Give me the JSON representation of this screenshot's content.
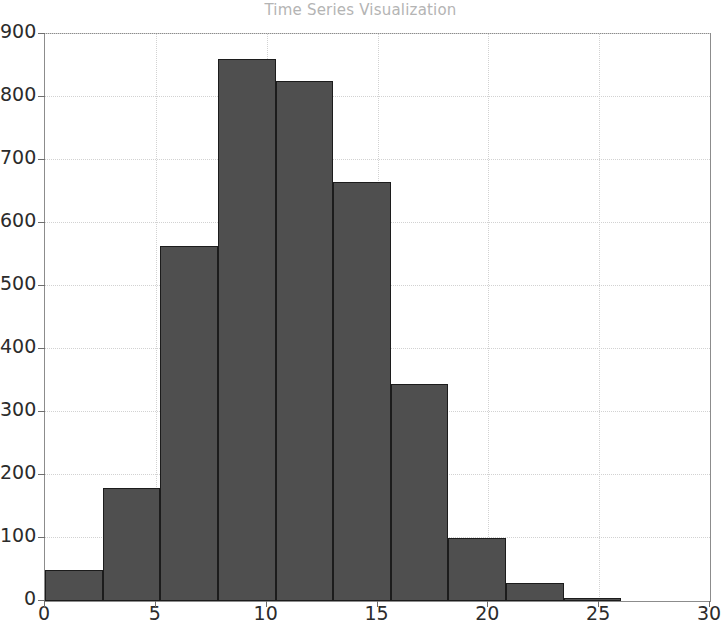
{
  "chart_data": {
    "type": "bar",
    "title": "Time Series Visualization",
    "xlabel": "",
    "ylabel": "",
    "xlim": [
      0,
      30
    ],
    "ylim": [
      0,
      900
    ],
    "grid": true,
    "legend": null,
    "bar_color": "#4f4f4f",
    "bar_edge_color": "#1c1c1c",
    "bin_edges": [
      0,
      2.6,
      5.2,
      7.8,
      10.4,
      13.0,
      15.6,
      18.2,
      20.8,
      23.4,
      26.0
    ],
    "categories": [
      "0-2.6",
      "2.6-5.2",
      "5.2-7.8",
      "7.8-10.4",
      "10.4-13.0",
      "13.0-15.6",
      "15.6-18.2",
      "18.2-20.8",
      "20.8-23.4",
      "23.4-26.0"
    ],
    "values": [
      50,
      180,
      563,
      860,
      825,
      665,
      345,
      100,
      28,
      5
    ],
    "xticks": [
      0,
      5,
      10,
      15,
      20,
      25,
      30
    ],
    "xtick_labels": [
      "0",
      "5",
      "10",
      "15",
      "20",
      "25",
      "30"
    ],
    "yticks": [
      0,
      100,
      200,
      300,
      400,
      500,
      600,
      700,
      800,
      900
    ],
    "ytick_labels": [
      "0",
      "100",
      "200",
      "300",
      "400",
      "500",
      "600",
      "700",
      "800",
      "900"
    ]
  }
}
